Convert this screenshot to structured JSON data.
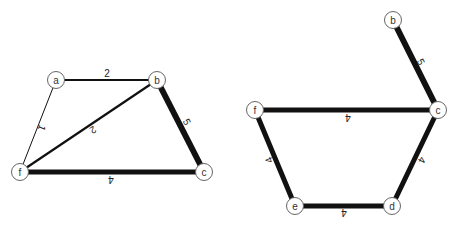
{
  "graphs": [
    {
      "name": "left-graph",
      "nodes": [
        {
          "id": "a",
          "label": "a",
          "x": 56,
          "y": 80
        },
        {
          "id": "b",
          "label": "b",
          "x": 157,
          "y": 80
        },
        {
          "id": "f",
          "label": "f",
          "x": 20,
          "y": 172
        },
        {
          "id": "c",
          "label": "c",
          "x": 204,
          "y": 172
        }
      ],
      "edges": [
        {
          "from": "a",
          "to": "b",
          "weight": "2",
          "width": 2.2,
          "label_x": 107,
          "label_y": 73,
          "label_rot": 0
        },
        {
          "from": "a",
          "to": "f",
          "weight": "1",
          "width": 1,
          "label_x": 42,
          "label_y": 128,
          "label_rot": 112
        },
        {
          "from": "f",
          "to": "b",
          "weight": "2",
          "width": 2.2,
          "label_x": 93,
          "label_y": 130,
          "label_rot": 148
        },
        {
          "from": "b",
          "to": "c",
          "weight": "5",
          "width": 6,
          "label_x": 187,
          "label_y": 122,
          "label_rot": 63
        },
        {
          "from": "f",
          "to": "c",
          "weight": "4",
          "width": 5,
          "label_x": 111,
          "label_y": 179,
          "label_rot": 180
        }
      ]
    },
    {
      "name": "right-graph",
      "nodes": [
        {
          "id": "b",
          "label": "b",
          "x": 393,
          "y": 20
        },
        {
          "id": "c",
          "label": "c",
          "x": 438,
          "y": 110
        },
        {
          "id": "f",
          "label": "f",
          "x": 255,
          "y": 110
        },
        {
          "id": "e",
          "label": "e",
          "x": 295,
          "y": 206
        },
        {
          "id": "d",
          "label": "d",
          "x": 392,
          "y": 206
        }
      ],
      "edges": [
        {
          "from": "b",
          "to": "c",
          "weight": "5",
          "width": 6,
          "label_x": 421,
          "label_y": 62,
          "label_rot": 63
        },
        {
          "from": "f",
          "to": "c",
          "weight": "4",
          "width": 5,
          "label_x": 348,
          "label_y": 117,
          "label_rot": 180
        },
        {
          "from": "f",
          "to": "e",
          "weight": "4",
          "width": 5,
          "label_x": 269,
          "label_y": 160,
          "label_rot": 247
        },
        {
          "from": "e",
          "to": "d",
          "weight": "4",
          "width": 5,
          "label_x": 344,
          "label_y": 212,
          "label_rot": 180
        },
        {
          "from": "c",
          "to": "d",
          "weight": "4",
          "width": 5,
          "label_x": 422,
          "label_y": 160,
          "label_rot": 116
        }
      ]
    }
  ],
  "colors": {
    "edge": "#111111",
    "node_fill": "#ffffff",
    "node_stroke": "#666666",
    "background": "#ffffff"
  }
}
